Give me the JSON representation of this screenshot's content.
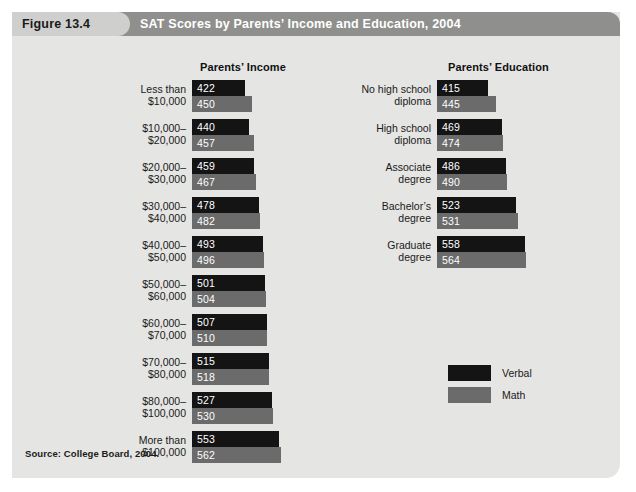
{
  "figure": {
    "number_label": "Figure 13.4",
    "title": "SAT Scores by Parents’ Income and Education, 2004",
    "source": "Source: College Board, 2004."
  },
  "sections": {
    "income_title": "Parents’ Income",
    "education_title": "Parents’ Education"
  },
  "legend": {
    "verbal_label": "Verbal",
    "math_label": "Math"
  },
  "colors": {
    "verbal": "#141414",
    "math": "#6b6b6b",
    "panel": "#e5e5e3",
    "header_band": "#8f8f8d",
    "header_tab": "#cfcfcd"
  },
  "chart_data": {
    "type": "bar",
    "title": "SAT Scores by Parents’ Income and Education, 2004",
    "subtitle": "",
    "xlabel": "SAT score",
    "ylabel": "",
    "orientation": "horizontal",
    "grid": false,
    "legend_position": "middle-right",
    "xlim": [
      0,
      600
    ],
    "series_names": [
      "Verbal",
      "Math"
    ],
    "panels": [
      {
        "name": "Parents’ Income",
        "categories": [
          "Less than $10,000",
          "$10,000–$20,000",
          "$20,000–$30,000",
          "$30,000–$40,000",
          "$40,000–$50,000",
          "$50,000–$60,000",
          "$60,000–$70,000",
          "$70,000–$80,000",
          "$80,000–$100,000",
          "More than $100,000"
        ],
        "category_lines": [
          [
            "Less than",
            "$10,000"
          ],
          [
            "$10,000–",
            "$20,000"
          ],
          [
            "$20,000–",
            "$30,000"
          ],
          [
            "$30,000–",
            "$40,000"
          ],
          [
            "$40,000–",
            "$50,000"
          ],
          [
            "$50,000–",
            "$60,000"
          ],
          [
            "$60,000–",
            "$70,000"
          ],
          [
            "$70,000–",
            "$80,000"
          ],
          [
            "$80,000–",
            "$100,000"
          ],
          [
            "More than",
            "$100,000"
          ]
        ],
        "series": [
          {
            "name": "Verbal",
            "values": [
              422,
              440,
              459,
              478,
              493,
              501,
              507,
              515,
              527,
              553
            ]
          },
          {
            "name": "Math",
            "values": [
              450,
              457,
              467,
              482,
              496,
              504,
              510,
              518,
              530,
              562
            ]
          }
        ]
      },
      {
        "name": "Parents’ Education",
        "categories": [
          "No high school diploma",
          "High school diploma",
          "Associate degree",
          "Bachelor’s degree",
          "Graduate degree"
        ],
        "category_lines": [
          [
            "No high school",
            "diploma"
          ],
          [
            "High school",
            "diploma"
          ],
          [
            "Associate",
            "degree"
          ],
          [
            "Bachelor’s",
            "degree"
          ],
          [
            "Graduate",
            "degree"
          ]
        ],
        "series": [
          {
            "name": "Verbal",
            "values": [
              415,
              469,
              486,
              523,
              558
            ]
          },
          {
            "name": "Math",
            "values": [
              445,
              474,
              490,
              531,
              564
            ]
          }
        ]
      }
    ]
  }
}
